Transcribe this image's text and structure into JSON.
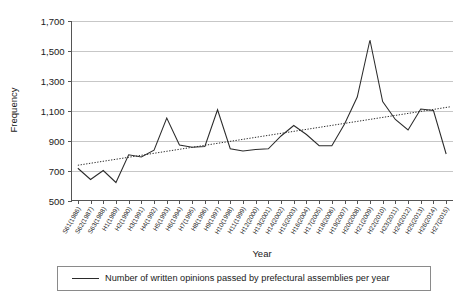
{
  "chart_data": {
    "type": "line",
    "title": "",
    "xlabel": "Year",
    "ylabel": "Frequency",
    "ylim": [
      500,
      1700
    ],
    "ytick_values": [
      500,
      700,
      900,
      1100,
      1300,
      1500,
      1700
    ],
    "ytick_labels": [
      "500",
      "700",
      "900",
      "1,100",
      "1,300",
      "1,500",
      "1,700"
    ],
    "grid": true,
    "legend_position": "bottom",
    "categories": [
      "S61(1986)",
      "S62(1987)",
      "S63(1988)",
      "H1(1989)",
      "H2(1990)",
      "H3(1991)",
      "H4(1992)",
      "H5(1993)",
      "H6(1994)",
      "H7(1995)",
      "H8(1996)",
      "H9(1997)",
      "H10(1998)",
      "H11(1999)",
      "H12(2000)",
      "H13(2001)",
      "H14(2002)",
      "H15(2003)",
      "H16(2004)",
      "H17(2005)",
      "H18(2006)",
      "H19(2007)",
      "H20(2008)",
      "H21(2009)",
      "H22(2010)",
      "H23(2011)",
      "H24(2012)",
      "H25(2013)",
      "H26(2014)",
      "H27(2015)"
    ],
    "series": [
      {
        "name": "Number of written opinions passed by prefectural assemblies per year",
        "values": [
          715,
          640,
          700,
          620,
          805,
          790,
          835,
          1050,
          870,
          855,
          860,
          1105,
          845,
          830,
          840,
          845,
          930,
          1000,
          940,
          865,
          865,
          1010,
          1190,
          1570,
          1160,
          1040,
          970,
          1110,
          1100,
          810
        ]
      }
    ],
    "trend": {
      "name": "linear-trendline",
      "style": "dotted",
      "start_value": 735,
      "end_value": 1125
    },
    "legend_entries": [
      "Number of written opinions passed by prefectural assemblies per year"
    ]
  }
}
